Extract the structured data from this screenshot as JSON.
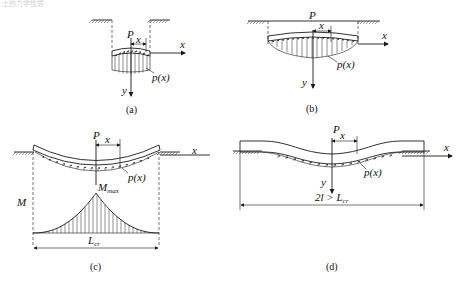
{
  "header_faint_text": "土的力学性质",
  "panels": [
    {
      "id": "a",
      "caption": "(a)",
      "labels": {
        "force": "P",
        "offset": "x",
        "x_axis": "x",
        "y_axis": "y",
        "pressure": "p(x)"
      }
    },
    {
      "id": "b",
      "caption": "(b)",
      "labels": {
        "force": "P",
        "offset": "x",
        "x_axis": "x",
        "y_axis": "y",
        "pressure": "p(x)"
      }
    },
    {
      "id": "c",
      "caption": "(c)",
      "labels": {
        "force": "P",
        "offset": "x",
        "x_axis": "x",
        "pressure": "p(x)",
        "moment_axis": "M",
        "moment_max": "M",
        "moment_max_sub": "max",
        "length": "L",
        "length_sub": "cr"
      }
    },
    {
      "id": "d",
      "caption": "(d)",
      "labels": {
        "force": "P",
        "offset": "x",
        "x_axis": "x",
        "y_axis": "y",
        "pressure": "p(x)",
        "length_prefix": "2l > L",
        "length_sub": "cr"
      }
    }
  ]
}
